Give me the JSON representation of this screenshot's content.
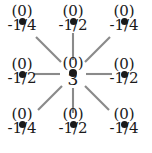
{
  "figure": {
    "background_color": "#ffffff",
    "ink_color": "#1a1a1a",
    "edge_color": "#8a8a8a"
  },
  "nodes": [
    {
      "id": "top-left",
      "upper_label": "(0)",
      "lower_label": "-1/4",
      "x": 22,
      "y": 21
    },
    {
      "id": "top-center",
      "upper_label": "(0)",
      "lower_label": "-1/2",
      "x": 73,
      "y": 21
    },
    {
      "id": "top-right",
      "upper_label": "(0)",
      "lower_label": "-1/4",
      "x": 124,
      "y": 21
    },
    {
      "id": "middle-left",
      "upper_label": "(0)",
      "lower_label": "-1/2",
      "x": 22,
      "y": 74
    },
    {
      "id": "center",
      "upper_label": "(0)",
      "lower_label": "3",
      "x": 73,
      "y": 73
    },
    {
      "id": "middle-right",
      "upper_label": "(0)",
      "lower_label": "-1/2",
      "x": 124,
      "y": 74
    },
    {
      "id": "bottom-left",
      "upper_label": "(0)",
      "lower_label": "-1/4",
      "x": 22,
      "y": 124
    },
    {
      "id": "bottom-center",
      "upper_label": "(0)",
      "lower_label": "-1/2",
      "x": 73,
      "y": 124
    },
    {
      "id": "bottom-right",
      "upper_label": "(0)",
      "lower_label": "-1/4",
      "x": 124,
      "y": 124
    }
  ],
  "edges": [
    {
      "id": "edge-center-top-left",
      "x1": 61,
      "y1": 62,
      "x2": 36,
      "y2": 37
    },
    {
      "id": "edge-center-top-center",
      "x1": 73,
      "y1": 60,
      "x2": 73,
      "y2": 33
    },
    {
      "id": "edge-center-top-right",
      "x1": 85,
      "y1": 62,
      "x2": 110,
      "y2": 37
    },
    {
      "id": "edge-center-middle-left",
      "x1": 60,
      "y1": 74,
      "x2": 34,
      "y2": 74
    },
    {
      "id": "edge-center-middle-right",
      "x1": 86,
      "y1": 74,
      "x2": 112,
      "y2": 74
    },
    {
      "id": "edge-center-bottom-left",
      "x1": 62,
      "y1": 86,
      "x2": 38,
      "y2": 110
    },
    {
      "id": "edge-center-bottom-center",
      "x1": 73,
      "y1": 88,
      "x2": 73,
      "y2": 113
    },
    {
      "id": "edge-center-bottom-right",
      "x1": 85,
      "y1": 86,
      "x2": 109,
      "y2": 110
    }
  ],
  "chart_data": {
    "type": "diagram",
    "grid_shape": [
      3,
      3
    ],
    "upper_values": [
      [
        "(0)",
        "(0)",
        "(0)"
      ],
      [
        "(0)",
        "(0)",
        "(0)"
      ],
      [
        "(0)",
        "(0)",
        "(0)"
      ]
    ],
    "coefficients": [
      [
        "-1/4",
        "-1/2",
        "-1/4"
      ],
      [
        "-1/2",
        "3",
        "-1/2"
      ],
      [
        "-1/4",
        "-1/2",
        "-1/4"
      ]
    ],
    "coefficient_values": [
      [
        -0.25,
        -0.5,
        -0.25
      ],
      [
        -0.5,
        3,
        -0.5
      ],
      [
        -0.25,
        -0.5,
        -0.25
      ]
    ],
    "center_value": "3",
    "legend": [],
    "xlabel": "",
    "ylabel": ""
  }
}
